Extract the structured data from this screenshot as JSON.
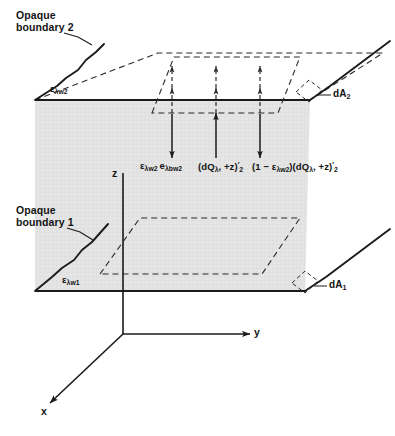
{
  "figure": {
    "type": "technical-line-diagram",
    "background_color": "#ffffff",
    "line_color": "#1a1a1a",
    "plane_fill_color": "#e3e3e3",
    "plane_fill_edge_color": "#9a9a9a"
  },
  "labels": {
    "opaque_boundary_2": "Opaque\nboundary 2",
    "opaque_boundary_1": "Opaque\nboundary 1",
    "emissivity_w2": {
      "symbol": "ε",
      "sub": "λw2"
    },
    "emissivity_w1": {
      "symbol": "ε",
      "sub": "λw1"
    },
    "area_element_2": {
      "symbol": "dA",
      "sub": "2"
    },
    "area_element_1": {
      "symbol": "dA",
      "sub": "1"
    }
  },
  "axes": {
    "x_label": "x",
    "y_label": "y",
    "z_label": "z",
    "origin": {
      "x": 123,
      "y": 334
    }
  },
  "flux_terms": [
    {
      "id": "emitted-flux",
      "direction": "down",
      "text_plain": "ελw2 ελbw2",
      "parts": [
        {
          "symbol": "ε",
          "sub": "λw2"
        },
        {
          "symbol": "e",
          "sub": "λbw2"
        }
      ]
    },
    {
      "id": "incident-flux",
      "direction": "up",
      "text_plain": "(dQλ, +z)′ 2",
      "lead": "(dQ",
      "sub1": "λ",
      "mid": ", +z",
      "prime": "′",
      "sub2": "2"
    },
    {
      "id": "reflected-flux",
      "direction": "down",
      "text_plain": "(1 − ελw2)(dQλ, +z)′ 2",
      "prefix_open": "(1 − ",
      "prefix_symbol": "ε",
      "prefix_sub": "λw2",
      "prefix_close": ")",
      "lead": "(dQ",
      "sub1": "λ",
      "mid": ", +z",
      "prime": "′",
      "sub2": "2"
    }
  ],
  "arrows": {
    "dashed_up_count": 3,
    "solid_count": 3,
    "dashed_x_positions": [
      172,
      216,
      260
    ],
    "solid_x_positions": [
      172,
      216,
      260
    ]
  }
}
